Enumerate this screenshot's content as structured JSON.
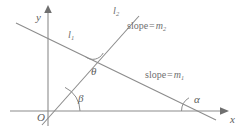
{
  "figure": {
    "type": "geometry-diagram",
    "background_color": "#ffffff",
    "stroke_color": "#8c8c8c",
    "text_color": "#6f6f6f"
  },
  "axes": {
    "x_label": "x",
    "y_label": "y",
    "origin_label": "O"
  },
  "lines": [
    {
      "name": "line-1",
      "label": "l",
      "label_sub": "1",
      "slope_prefix": "slope",
      "slope_equals": "=",
      "slope_symbol": "m",
      "slope_sub": "1",
      "slope_label": "slope = m1",
      "inclination_angle": "α"
    },
    {
      "name": "line-2",
      "label": "l",
      "label_sub": "2",
      "slope_prefix": "slope",
      "slope_equals": "=",
      "slope_symbol": "m",
      "slope_sub": "2",
      "slope_label": "slope = m2",
      "inclination_angle": "β"
    }
  ],
  "angles": {
    "alpha": "α",
    "beta": "β",
    "theta": "θ"
  }
}
